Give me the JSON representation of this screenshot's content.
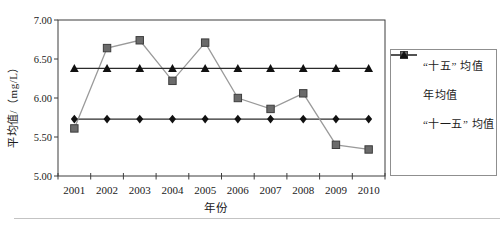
{
  "figure": {
    "background": "#ffffff",
    "x_axis_title": "年份",
    "y_axis_title": "平均值/（mg/L）"
  },
  "chart_data": {
    "type": "line",
    "title": "",
    "xlabel": "年份",
    "ylabel": "平均值/（mg/L）",
    "x": [
      2001,
      2002,
      2003,
      2004,
      2005,
      2006,
      2007,
      2008,
      2009,
      2010
    ],
    "ylim": [
      5.0,
      7.0
    ],
    "y_ticks": {
      "values": [
        5.0,
        5.5,
        6.0,
        6.5,
        7.0
      ],
      "labels": [
        "5.00",
        "5.50",
        "6.00",
        "6.50",
        "7.00"
      ]
    },
    "grid": false,
    "legend_position": "right",
    "series": [
      {
        "name": "“十五” 均值",
        "marker": "diamond",
        "line_color": "#2b2b2b",
        "marker_color": "#111111",
        "values": [
          5.73,
          5.73,
          5.73,
          5.73,
          5.73,
          5.73,
          5.73,
          5.73,
          5.73,
          5.73
        ]
      },
      {
        "name": "年均值",
        "marker": "square",
        "line_color": "#9a9a9a",
        "marker_color": "#6b6b6b",
        "marker_stroke": "#3d3d3d",
        "values": [
          5.61,
          6.64,
          6.74,
          6.22,
          6.71,
          6.0,
          5.86,
          6.06,
          5.4,
          5.34
        ]
      },
      {
        "name": "“十一五” 均值",
        "marker": "triangle",
        "line_color": "#2b2b2b",
        "marker_color": "#111111",
        "values": [
          6.38,
          6.38,
          6.38,
          6.38,
          6.38,
          6.38,
          6.38,
          6.38,
          6.38,
          6.38
        ]
      }
    ]
  },
  "legend": {
    "items": [
      {
        "label": "“十五” 均值",
        "marker": "diamond"
      },
      {
        "label": "年均值",
        "marker": "square"
      },
      {
        "label": "“十一五” 均值",
        "marker": "triangle"
      }
    ]
  },
  "colors": {
    "axis": "#3d3d3d",
    "black_series": "#2b2b2b",
    "gray_series": "#9a9a9a",
    "gray_marker_fill": "#6b6b6b",
    "legend_border": "#8f8f8f",
    "text": "#1a1a1a"
  }
}
